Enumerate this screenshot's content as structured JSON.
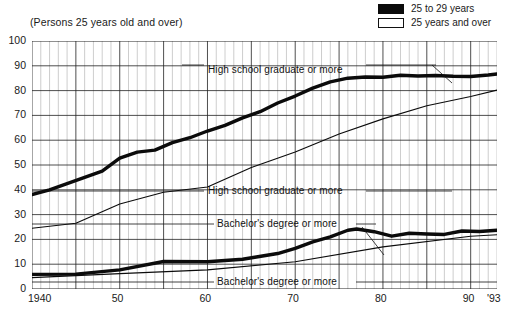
{
  "subtitle": "(Persons 25 years old and over)",
  "legend": {
    "position": "top-right",
    "items": [
      {
        "label": "25 to 29 years",
        "style": "filled",
        "color": "#0b0b0b"
      },
      {
        "label": "25 years and over",
        "style": "open",
        "color": "#ffffff"
      }
    ]
  },
  "annotations": [
    {
      "text": "High school graduate or more",
      "series": "hs_25_29"
    },
    {
      "text": "High school graduate or more",
      "series": "hs_25_over"
    },
    {
      "text": "Bachelor's degree or more",
      "series": "ba_25_29"
    },
    {
      "text": "Bachelor's degree or more",
      "series": "ba_25_over"
    }
  ],
  "chart_data": {
    "type": "line",
    "title": "",
    "subtitle": "(Persons 25 years old and over)",
    "xlabel": "",
    "ylabel": "",
    "xlim": [
      1940,
      1993
    ],
    "ylim": [
      0,
      100
    ],
    "yticks": [
      0,
      10,
      20,
      30,
      40,
      50,
      60,
      70,
      80,
      90,
      100
    ],
    "xticks": [
      1940,
      1950,
      1960,
      1970,
      1980,
      1990,
      1993
    ],
    "xticklabels": [
      "1940",
      "50",
      "60",
      "70",
      "80",
      "90",
      "'93"
    ],
    "grid": true,
    "grid_minor_x": "annual",
    "legend_position": "top-right",
    "series": [
      {
        "name": "High school graduate or more — 25 to 29 years",
        "short": "hs_25_29",
        "style": "thick-black",
        "x": [
          1940,
          1942,
          1944,
          1946,
          1948,
          1950,
          1952,
          1954,
          1956,
          1958,
          1960,
          1962,
          1964,
          1966,
          1968,
          1970,
          1972,
          1974,
          1976,
          1978,
          1980,
          1982,
          1984,
          1986,
          1988,
          1990,
          1992,
          1993
        ],
        "values": [
          38.1,
          40.0,
          42.5,
          45.0,
          47.5,
          52.8,
          55.2,
          56.0,
          59.0,
          61.0,
          63.7,
          66.0,
          69.0,
          71.5,
          75.0,
          77.8,
          81.0,
          83.5,
          85.0,
          85.5,
          85.4,
          86.2,
          85.9,
          86.1,
          85.8,
          85.7,
          86.3,
          86.7
        ]
      },
      {
        "name": "High school graduate or more — 25 years and over",
        "short": "hs_25_over",
        "style": "thin-black",
        "x": [
          1940,
          1945,
          1950,
          1955,
          1960,
          1965,
          1970,
          1975,
          1980,
          1985,
          1990,
          1993
        ],
        "values": [
          24.5,
          26.5,
          34.3,
          39.0,
          41.1,
          49.0,
          55.2,
          62.5,
          68.6,
          73.9,
          77.6,
          80.2
        ]
      },
      {
        "name": "Bachelor's degree or more — 25 to 29 years",
        "short": "ba_25_29",
        "style": "thick-black",
        "x": [
          1940,
          1945,
          1950,
          1955,
          1960,
          1964,
          1968,
          1970,
          1972,
          1974,
          1976,
          1977,
          1979,
          1981,
          1983,
          1985,
          1987,
          1989,
          1991,
          1993
        ],
        "values": [
          5.9,
          6.0,
          7.7,
          11.1,
          11.0,
          12.0,
          14.3,
          16.4,
          19.0,
          21.0,
          23.7,
          24.2,
          23.1,
          21.3,
          22.5,
          22.2,
          22.0,
          23.4,
          23.2,
          23.7
        ]
      },
      {
        "name": "Bachelor's degree or more — 25 years and over",
        "short": "ba_25_over",
        "style": "thin-black",
        "x": [
          1940,
          1950,
          1960,
          1970,
          1980,
          1990,
          1993
        ],
        "values": [
          4.6,
          6.2,
          7.7,
          11.0,
          17.0,
          21.3,
          21.9
        ]
      }
    ]
  }
}
